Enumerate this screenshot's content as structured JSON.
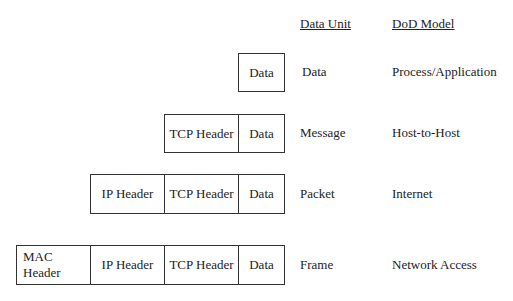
{
  "columns": {
    "data_unit": "Data Unit",
    "dod_model": "DoD Model"
  },
  "rows": [
    {
      "unit": "Data",
      "model": "Process/Application",
      "boxes": [
        "Data"
      ]
    },
    {
      "unit": "Message",
      "model": "Host-to-Host",
      "boxes": [
        "TCP Header",
        "Data"
      ]
    },
    {
      "unit": "Packet",
      "model": "Internet",
      "boxes": [
        "IP Header",
        "TCP Header",
        "Data"
      ]
    },
    {
      "unit": "Frame",
      "model": "Network Access",
      "boxes": [
        "MAC Header",
        "IP Header",
        "TCP Header",
        "Data"
      ]
    }
  ]
}
